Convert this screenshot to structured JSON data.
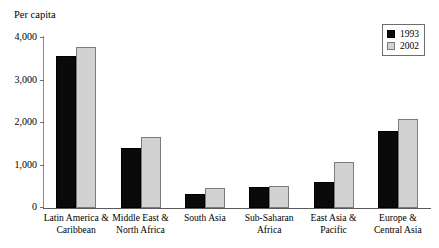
{
  "chart_data": {
    "type": "bar",
    "title": "",
    "ylabel": "Per capita",
    "xlabel": "",
    "ylim": [
      0,
      4000
    ],
    "yticks": [
      0,
      1000,
      2000,
      3000,
      4000
    ],
    "ytick_labels": [
      "0",
      "1,000",
      "2,000",
      "3,000",
      "4,000"
    ],
    "grid": false,
    "legend_position": "top-right",
    "categories": [
      "Latin America &\nCaribbean",
      "Middle East &\nNorth Africa",
      "South Asia",
      "Sub-Saharan\nAfrica",
      "East Asia &\nPacific",
      "Europe &\nCentral Asia"
    ],
    "series": [
      {
        "name": "1993",
        "color": "#0a0a0a",
        "values": [
          3570,
          1420,
          330,
          500,
          620,
          1810
        ]
      },
      {
        "name": "2002",
        "color": "#d2d2d2",
        "values": [
          3800,
          1680,
          470,
          510,
          1080,
          2100
        ]
      }
    ]
  }
}
